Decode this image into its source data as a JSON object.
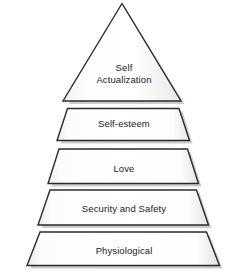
{
  "diagram": {
    "shape": "pyramid",
    "tier_count": 5,
    "fill_color": "#fbfbfb",
    "edge_color": "#2b2b2b",
    "shadow_color": "#9a9a9a",
    "text_color": "#1b1b1b",
    "background_color": "#ffffff"
  },
  "tiers": [
    {
      "index": 1,
      "position": "top",
      "shape": "triangle",
      "label": "Self\nActualization",
      "label_line1": "Self",
      "label_line2": "Actualization"
    },
    {
      "index": 2,
      "position": "second",
      "shape": "trapezoid",
      "label": "Self-esteem"
    },
    {
      "index": 3,
      "position": "middle",
      "shape": "trapezoid",
      "label": "Love"
    },
    {
      "index": 4,
      "position": "fourth",
      "shape": "trapezoid",
      "label": "Security and Safety"
    },
    {
      "index": 5,
      "position": "bottom",
      "shape": "trapezoid",
      "label": "Physiological"
    }
  ]
}
